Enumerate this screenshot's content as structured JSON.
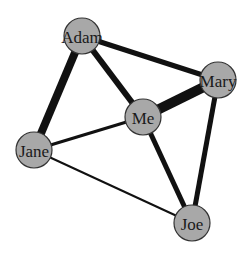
{
  "diagram": {
    "type": "network-graph",
    "node_radius": 18,
    "colors": {
      "background": "#ffffff",
      "node_fill": "#a8a8a8",
      "node_stroke": "#333333",
      "edge": "#111111",
      "label": "#1a1a1a"
    },
    "nodes": [
      {
        "id": "adam",
        "label": "Adam",
        "x": 82,
        "y": 36
      },
      {
        "id": "mary",
        "label": "Mary",
        "x": 218,
        "y": 80
      },
      {
        "id": "me",
        "label": "Me",
        "x": 143,
        "y": 117
      },
      {
        "id": "jane",
        "label": "Jane",
        "x": 34,
        "y": 150
      },
      {
        "id": "joe",
        "label": "Joe",
        "x": 192,
        "y": 223
      }
    ],
    "edges": [
      {
        "source": "adam",
        "target": "jane",
        "weight": 8
      },
      {
        "source": "adam",
        "target": "me",
        "weight": 6
      },
      {
        "source": "adam",
        "target": "mary",
        "weight": 5
      },
      {
        "source": "me",
        "target": "mary",
        "weight": 10
      },
      {
        "source": "mary",
        "target": "joe",
        "weight": 5
      },
      {
        "source": "me",
        "target": "joe",
        "weight": 5
      },
      {
        "source": "jane",
        "target": "me",
        "weight": 3
      },
      {
        "source": "jane",
        "target": "joe",
        "weight": 2
      }
    ]
  }
}
